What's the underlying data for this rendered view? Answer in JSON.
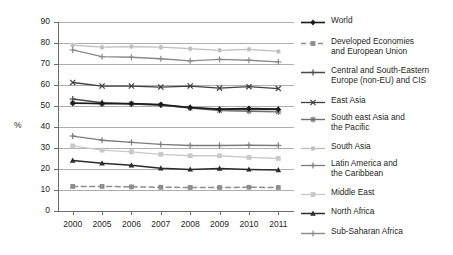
{
  "chart_data": {
    "type": "line",
    "title": "",
    "subtitle": "",
    "xlabel": "",
    "ylabel": "%",
    "ylim": [
      0,
      90
    ],
    "ytick_step": 10,
    "yticks": [
      90,
      80,
      70,
      60,
      50,
      40,
      30,
      20,
      10,
      0
    ],
    "grid": true,
    "grid_axis": "y",
    "legend_position": "right",
    "categories": [
      "2000",
      "2005",
      "2006",
      "2007",
      "2008",
      "2009",
      "2010",
      "2011"
    ],
    "x": [
      2000,
      2005,
      2006,
      2007,
      2008,
      2009,
      2010,
      2011
    ],
    "series": [
      {
        "name": "World",
        "color": "#1a1a1a",
        "marker": "diamond",
        "dash": "solid",
        "width": 1.6,
        "values": [
          51.3,
          51.2,
          51.2,
          50.7,
          49.3,
          48.5,
          48.8,
          48.5
        ]
      },
      {
        "name": "Developed Economies and European Union",
        "color": "#8d8d8d",
        "marker": "square",
        "dash": "dashed",
        "width": 1.5,
        "values": [
          11.7,
          11.7,
          11.5,
          11.3,
          11.2,
          11.2,
          11.3,
          11.2
        ]
      },
      {
        "name": "Central and South-Eastern Europe (non-EU) and CIS",
        "color": "#4a4a4a",
        "marker": "plus",
        "dash": "solid",
        "width": 1.5,
        "values": [
          53.3,
          51.5,
          51.0,
          50.5,
          49.2,
          48.3,
          48.5,
          48.3
        ]
      },
      {
        "name": "East Asia",
        "color": "#3f3f3f",
        "marker": "x",
        "dash": "solid",
        "width": 1.3,
        "values": [
          61.2,
          59.5,
          59.5,
          59.0,
          59.5,
          58.5,
          59.2,
          58.3
        ]
      },
      {
        "name": "South east Asia and the Pacific",
        "color": "#6f6f6f",
        "marker": "star",
        "dash": "solid",
        "width": 1.4,
        "values": [
          51.5,
          51.0,
          51.0,
          50.5,
          49.0,
          47.8,
          47.5,
          47.2
        ]
      },
      {
        "name": "South Asia",
        "color": "#bdbdbd",
        "marker": "circle",
        "dash": "solid",
        "width": 1.3,
        "values": [
          79.0,
          78.0,
          78.3,
          78.0,
          77.3,
          76.5,
          77.0,
          76.0
        ]
      },
      {
        "name": "Latin America and the Caribbean",
        "color": "#7b7b7b",
        "marker": "plus",
        "dash": "solid",
        "width": 1.3,
        "values": [
          35.7,
          33.7,
          32.7,
          31.7,
          31.2,
          31.2,
          31.3,
          31.2
        ]
      },
      {
        "name": "Middle East",
        "color": "#c9c9c9",
        "marker": "square",
        "dash": "solid",
        "width": 1.3,
        "values": [
          31.0,
          29.0,
          28.2,
          27.0,
          26.3,
          26.3,
          25.5,
          25.0
        ]
      },
      {
        "name": "North Africa",
        "color": "#2b2b2b",
        "marker": "triangle",
        "dash": "solid",
        "width": 1.5,
        "values": [
          24.0,
          22.7,
          21.8,
          20.3,
          19.8,
          20.2,
          19.8,
          19.5
        ]
      },
      {
        "name": "Sub-Saharan Africa",
        "color": "#8a8a8a",
        "marker": "plus",
        "dash": "solid",
        "width": 1.4,
        "values": [
          76.7,
          73.5,
          73.2,
          72.5,
          71.5,
          72.2,
          71.8,
          71.0
        ]
      }
    ]
  },
  "legend": {
    "entries": [
      {
        "label": "World",
        "lines": 1
      },
      {
        "label": "Developed Economies\nand European Union",
        "lines": 2
      },
      {
        "label": "Central and South-Eastern\nEurope (non-EU) and CIS",
        "lines": 2
      },
      {
        "label": "East Asia",
        "lines": 1
      },
      {
        "label": "South east Asia and\nthe Pacific",
        "lines": 2
      },
      {
        "label": "South Asia",
        "lines": 1
      },
      {
        "label": "Latin America and\nthe Caribbean",
        "lines": 2
      },
      {
        "label": "Middle East",
        "lines": 1
      },
      {
        "label": "North Africa",
        "lines": 1
      },
      {
        "label": "Sub-Saharan Africa",
        "lines": 1
      }
    ]
  },
  "axes": {
    "y_title": "%",
    "y_tick_labels": [
      "90",
      "80",
      "70",
      "60",
      "50",
      "40",
      "30",
      "20",
      "10",
      "0"
    ],
    "x_tick_labels": [
      "2000",
      "2005",
      "2006",
      "2007",
      "2008",
      "2009",
      "2010",
      "2011"
    ]
  }
}
